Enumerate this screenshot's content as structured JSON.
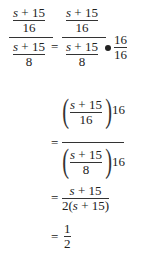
{
  "expression": {
    "line1": {
      "lhs": {
        "inner_num": "s + 15",
        "inner_num_den": "16",
        "inner_den": "s + 15",
        "inner_den_den": "8"
      },
      "rhs": {
        "inner_num": "s + 15",
        "inner_num_den": "16",
        "inner_den": "s + 15",
        "inner_den_den": "8"
      },
      "multiplier": {
        "num": "16",
        "den": "16"
      },
      "eq": "="
    },
    "line2": {
      "eq": "=",
      "top": {
        "num": "s + 15",
        "den": "16",
        "factor": "16"
      },
      "bottom": {
        "num": "s + 15",
        "den": "8",
        "factor": "16"
      }
    },
    "line3": {
      "eq": "=",
      "num": "s + 15",
      "den": "2(s + 15)"
    },
    "line4": {
      "eq": "=",
      "num": "1",
      "den": "2"
    }
  }
}
